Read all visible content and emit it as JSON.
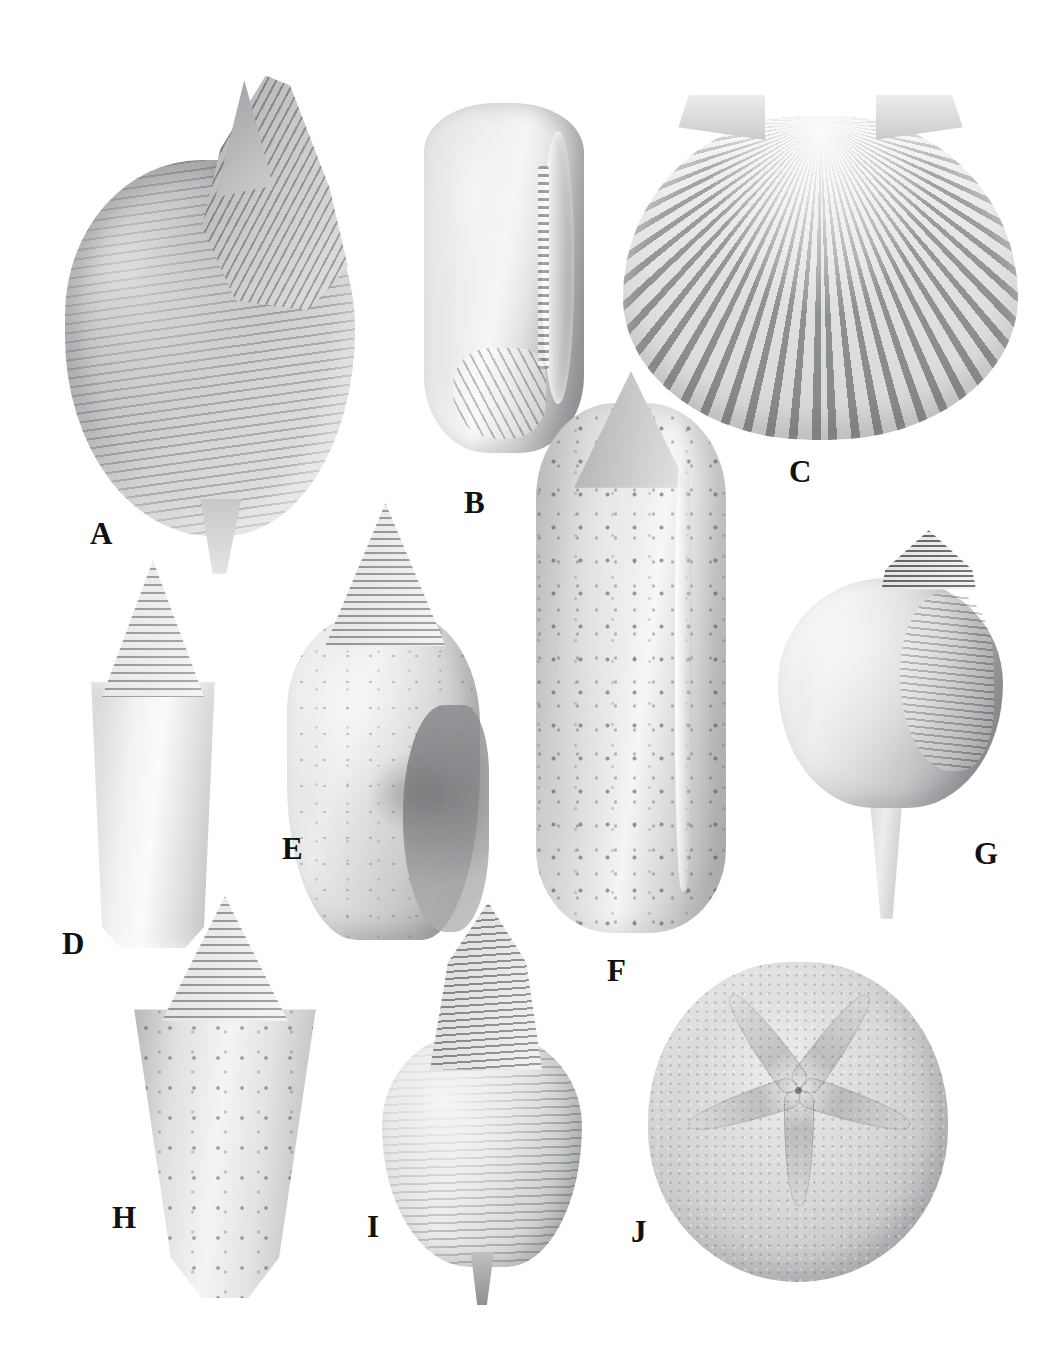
{
  "plate": {
    "background_color": "#ffffff",
    "label_color": "#111111",
    "width": 1058,
    "height": 1349,
    "description": "Monochrome photographic plate of ten fossil invertebrate specimens labelled A through J on a plain white background"
  },
  "specimens": [
    {
      "id": "a",
      "label": "A",
      "name": "ribbed-whelk-shell",
      "label_x": 90,
      "label_y": 518,
      "box": {
        "x": 58,
        "y": 85,
        "w": 345,
        "h": 470
      }
    },
    {
      "id": "b",
      "label": "B",
      "name": "olive-shell-aperture-view",
      "label_x": 464,
      "label_y": 487,
      "box": {
        "x": 424,
        "y": 103,
        "w": 160,
        "h": 350
      }
    },
    {
      "id": "c",
      "label": "C",
      "name": "scallop-pecten-valve",
      "label_x": 789,
      "label_y": 456,
      "box": {
        "x": 623,
        "y": 95,
        "w": 395,
        "h": 345
      }
    },
    {
      "id": "d",
      "label": "D",
      "name": "cone-shell-smooth",
      "label_x": 62,
      "label_y": 928,
      "box": {
        "x": 73,
        "y": 568,
        "w": 160,
        "h": 380
      }
    },
    {
      "id": "e",
      "label": "E",
      "name": "conch-shell-encrusted",
      "label_x": 282,
      "label_y": 833,
      "box": {
        "x": 278,
        "y": 520,
        "w": 215,
        "h": 420
      }
    },
    {
      "id": "f",
      "label": "F",
      "name": "speckled-olive-shell",
      "label_x": 607,
      "label_y": 955,
      "box": {
        "x": 536,
        "y": 403,
        "w": 190,
        "h": 530
      }
    },
    {
      "id": "g",
      "label": "G",
      "name": "pear-shaped-whelk",
      "label_x": 974,
      "label_y": 838,
      "box": {
        "x": 778,
        "y": 534,
        "w": 225,
        "h": 370
      }
    },
    {
      "id": "h",
      "label": "H",
      "name": "large-cone-shell-speckled",
      "label_x": 112,
      "label_y": 1202,
      "box": {
        "x": 120,
        "y": 908,
        "w": 210,
        "h": 390
      }
    },
    {
      "id": "i",
      "label": "I",
      "name": "ribbed-spired-whelk",
      "label_x": 367,
      "label_y": 1211,
      "box": {
        "x": 382,
        "y": 910,
        "w": 200,
        "h": 380
      }
    },
    {
      "id": "j",
      "label": "J",
      "name": "echinoid-sand-dollar-test",
      "label_x": 631,
      "label_y": 1216,
      "box": {
        "x": 648,
        "y": 962,
        "w": 300,
        "h": 320
      }
    }
  ]
}
